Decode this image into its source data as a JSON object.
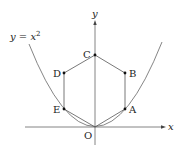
{
  "diagram": {
    "curve_label": "y = x",
    "curve_exponent": "2",
    "axis_x_label": "x",
    "axis_y_label": "y",
    "points": [
      {
        "name": "O",
        "x": 95,
        "y": 127
      },
      {
        "name": "A",
        "x": 125,
        "y": 109
      },
      {
        "name": "B",
        "x": 125,
        "y": 73
      },
      {
        "name": "C",
        "x": 95,
        "y": 55
      },
      {
        "name": "D",
        "x": 64,
        "y": 73
      },
      {
        "name": "E",
        "x": 64,
        "y": 109
      }
    ],
    "labels": {
      "O": "O",
      "A": "A",
      "B": "B",
      "C": "C",
      "D": "D",
      "E": "E"
    },
    "colors": {
      "line": "#555555",
      "point": "#111111",
      "text": "#222222"
    }
  }
}
